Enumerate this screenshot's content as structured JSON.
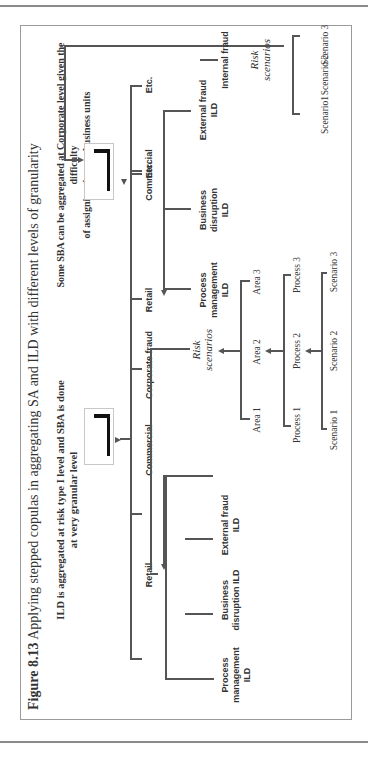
{
  "page": {
    "running_header": "risk and control models"
  },
  "figure": {
    "number": "Figure 8.13",
    "caption": "Applying stepped copulas in aggregating SA and ILD with different levels of granularity",
    "left_panel": {
      "subtitle_line1": "ILD is aggregated at risk type I level and SBA is done",
      "subtitle_line2": "at very granular level",
      "level1": [
        "Retail",
        "Commercial",
        "Corporate fraud",
        "Etc."
      ],
      "ild_nodes": [
        {
          "line1": "Process",
          "line2": "management",
          "line3": "ILD"
        },
        {
          "line1": "Business",
          "line2": "disruption ILD",
          "line3": ""
        },
        {
          "line1": "External fraud",
          "line2": "ILD",
          "line3": ""
        }
      ],
      "risk_scenarios": {
        "line1": "Risk",
        "line2": "scenarios"
      },
      "areas": [
        "Area 1",
        "Area 2",
        "Area 3"
      ],
      "processes": [
        "Process 1",
        "Process 2",
        "Process 3"
      ],
      "scenarios": [
        "Scenario 1",
        "Scenario 2",
        "Scenario 3"
      ]
    },
    "right_panel": {
      "subtitle_line1": "Some SBA can be aggregated at Corporate level given the difficulty",
      "subtitle_line2": "of assigning them to business units",
      "level1": [
        "Retail",
        "Commercial",
        "Etc."
      ],
      "ild_nodes": [
        {
          "line1": "Process",
          "line2": "management",
          "line3": "ILD"
        },
        {
          "line1": "Business",
          "line2": "disruption",
          "line3": "ILD"
        },
        {
          "line1": "External fraud",
          "line2": "ILD",
          "line3": ""
        }
      ],
      "internal_fraud": "Internal fraud",
      "risk_scenarios": {
        "line1": "Risk",
        "line2": "scenarios"
      },
      "scenarios": [
        "Scenario1",
        "Scenario 2",
        "Scenario 3"
      ]
    }
  }
}
